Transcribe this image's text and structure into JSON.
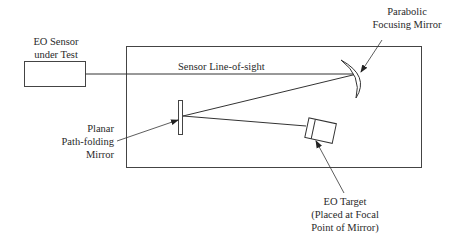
{
  "diagram": {
    "labels": {
      "sensor": [
        "EO Sensor",
        "under Test"
      ],
      "line_of_sight": "Sensor Line-of-sight",
      "parabolic_mirror": [
        "Parabolic",
        "Focusing Mirror"
      ],
      "planar_mirror": [
        "Planar",
        "Path-folding",
        "Mirror"
      ],
      "target": [
        "EO Target",
        "(Placed at Focal",
        "Point of Mirror)"
      ]
    },
    "colors": {
      "line": "#3a3a3a",
      "background": "#ffffff"
    }
  }
}
